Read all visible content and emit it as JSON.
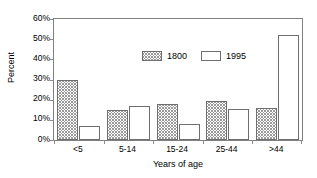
{
  "chart_data": {
    "type": "bar",
    "title": "",
    "xlabel": "Years of age",
    "ylabel": "Percent",
    "categories": [
      "<5",
      "5-14",
      "15-24",
      "25-44",
      ">44"
    ],
    "series": [
      {
        "name": "1800",
        "values": [
          30,
          15,
          18,
          19.5,
          16
        ]
      },
      {
        "name": "1995",
        "values": [
          7,
          17,
          8,
          15.5,
          52
        ]
      }
    ],
    "ylim": [
      0,
      60
    ],
    "ytick_values": [
      0,
      10,
      20,
      30,
      40,
      50,
      60
    ],
    "ytick_labels": [
      "0%",
      "10%",
      "20%",
      "30%",
      "40%",
      "50%",
      "60%"
    ],
    "grid": false,
    "legend_position": "inside-top-center",
    "colors": {
      "series_1800_fill": "#ffffff",
      "series_1800_hatch": "#9a9a9a",
      "series_1995_fill": "#ffffff",
      "bar_border": "#6e6e6e",
      "axis": "#808080",
      "text": "#000000"
    }
  }
}
